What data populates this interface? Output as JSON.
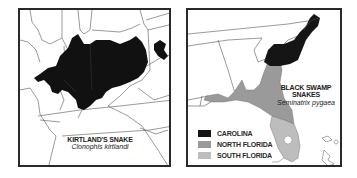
{
  "maps": [
    {
      "id": "kirtlands-snake",
      "title": "KIRTLAND'S SNAKE",
      "scientific_name": "Clonophis kirtlandi",
      "range_color": "#111111"
    },
    {
      "id": "black-swamp-snakes",
      "title": "BLACK SWAMP SNAKES",
      "scientific_name": "Seminatrix pygaea",
      "legend": [
        {
          "label": "CAROLINA",
          "color": "#151515"
        },
        {
          "label": "NORTH FLORIDA",
          "color": "#9a9a9a"
        },
        {
          "label": "SOUTH FLORIDA",
          "color": "#bdbdbd"
        }
      ]
    }
  ],
  "colors": {
    "border": "#2a2a2a",
    "state_lines": "#555555",
    "background": "#ffffff"
  }
}
